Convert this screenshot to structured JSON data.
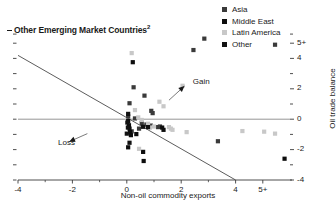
{
  "chart_data": {
    "type": "scatter",
    "title": "Other Emerging Market Countries",
    "title_superscript": "2",
    "xlabel": "Non-oil commodity exports",
    "ylabel": "Oil trade balance",
    "xlim": [
      -4,
      6
    ],
    "ylim": [
      -4,
      6
    ],
    "xticks": [
      "-4",
      "-2",
      "0",
      "2",
      "4",
      "5+"
    ],
    "xtick_values": [
      -4,
      -2,
      0,
      2,
      4,
      5
    ],
    "yticks": [
      "5+",
      "4",
      "2",
      "0",
      "-2",
      "-4"
    ],
    "ytick_values": [
      5,
      4,
      2,
      0,
      -2,
      -4
    ],
    "grid": false,
    "legend_position": "top-right",
    "series": [
      {
        "name": "Asia",
        "color": "#3a3a3a",
        "points": [
          [
            0.25,
            2.1
          ],
          [
            0.65,
            1.55
          ],
          [
            0.1,
            1.05
          ],
          [
            0.9,
            0.55
          ],
          [
            0.95,
            0.4
          ],
          [
            0.05,
            0.18
          ],
          [
            0.3,
            0.05
          ],
          [
            0.55,
            -0.25
          ],
          [
            0.72,
            -0.35
          ],
          [
            0.88,
            -0.42
          ],
          [
            1.15,
            -0.52
          ],
          [
            1.22,
            -0.48
          ],
          [
            0.45,
            -0.62
          ],
          [
            0.18,
            -0.8
          ],
          [
            2.45,
            4.55
          ],
          [
            2.85,
            5.3
          ],
          [
            5.45,
            4.9
          ],
          [
            3.35,
            -1.45
          ]
        ]
      },
      {
        "name": "Middle East",
        "color": "#0d0d0d",
        "points": [
          [
            0.22,
            3.75
          ],
          [
            0.05,
            -0.12
          ],
          [
            0.08,
            -0.4
          ],
          [
            0.1,
            -0.62
          ],
          [
            0.12,
            -0.85
          ],
          [
            0.15,
            -1.05
          ],
          [
            0.05,
            -1.85
          ],
          [
            0.6,
            -2.15
          ],
          [
            0.62,
            -2.75
          ],
          [
            0.35,
            -0.98
          ],
          [
            1.3,
            -0.55
          ],
          [
            1.35,
            -0.7
          ],
          [
            5.8,
            -2.6
          ]
        ]
      },
      {
        "name": "Latin America",
        "color": "#c8c8c8",
        "points": [
          [
            0.18,
            4.35
          ],
          [
            2.05,
            2.2
          ],
          [
            1.2,
            1.15
          ],
          [
            1.35,
            0.85
          ],
          [
            0.3,
            0.6
          ],
          [
            0.42,
            0.12
          ],
          [
            0.55,
            -0.05
          ],
          [
            0.78,
            -0.3
          ],
          [
            1.0,
            -0.48
          ],
          [
            1.55,
            -0.52
          ],
          [
            1.62,
            -0.62
          ],
          [
            1.68,
            -0.7
          ],
          [
            2.2,
            -0.85
          ],
          [
            4.25,
            -0.78
          ],
          [
            5.05,
            -0.82
          ],
          [
            5.45,
            -0.95
          ],
          [
            0.45,
            -1.95
          ],
          [
            0.85,
            -0.55
          ]
        ]
      },
      {
        "name": "Other",
        "color": "#111111",
        "points": [
          [
            0.05,
            0.35
          ],
          [
            0.02,
            -0.22
          ],
          [
            0.04,
            -0.55
          ],
          [
            0.0,
            -0.95
          ],
          [
            0.6,
            -0.5
          ],
          [
            0.78,
            -0.52
          ],
          [
            0.1,
            -1.55
          ]
        ]
      }
    ],
    "trendline": {
      "x1": -4,
      "y1": 4.2,
      "x2": 4,
      "y2": -4
    },
    "zero_line_y": 0,
    "annotations": [
      {
        "label": "Gain",
        "x": 2.35,
        "y": 2.35
      },
      {
        "label": "Loss",
        "x": -2.6,
        "y": -1.6
      }
    ]
  },
  "legend": {
    "items": [
      {
        "label": "Asia",
        "color": "#3a3a3a"
      },
      {
        "label": "Middle East",
        "color": "#0d0d0d"
      },
      {
        "label": "Latin America",
        "color": "#c8c8c8"
      },
      {
        "label": "Other",
        "color": "#111111"
      }
    ]
  },
  "colors": {
    "axis": "#3b3b3b",
    "text": "#1a1a1a",
    "zero_line": "#8a8a8a",
    "trendline": "#4a4a4a"
  }
}
